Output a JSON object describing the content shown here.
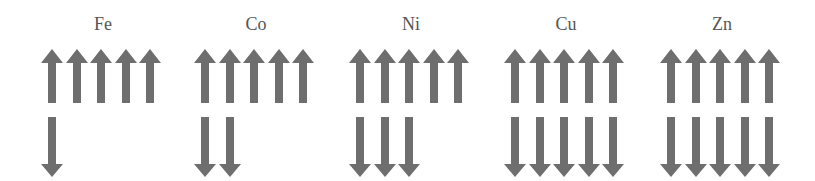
{
  "diagram": {
    "arrow_color": "#6e6e6e",
    "elements": [
      {
        "symbol": "Fe",
        "spin_up": 5,
        "spin_down": 1
      },
      {
        "symbol": "Co",
        "spin_up": 5,
        "spin_down": 2
      },
      {
        "symbol": "Ni",
        "spin_up": 5,
        "spin_down": 3
      },
      {
        "symbol": "Cu",
        "spin_up": 5,
        "spin_down": 5
      },
      {
        "symbol": "Zn",
        "spin_up": 5,
        "spin_down": 5
      }
    ]
  }
}
